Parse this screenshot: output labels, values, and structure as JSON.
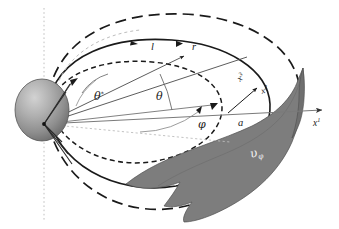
{
  "figure": {
    "background_color": "#ffffff",
    "width": 339,
    "height": 229
  },
  "colors": {
    "stroke": "#1a1a1a",
    "thin_stroke": "#555555",
    "sphere_light": "#c9c9c9",
    "sphere_mid": "#9a9a9a",
    "sphere_dark": "#666666",
    "sphere_edge": "#4a4a4a",
    "surface_gray": "#7d7d7d",
    "surface_edge": "#4f4f4f",
    "axis_gray": "#777777",
    "dotted_axis": "#b9b9b9",
    "label_on_gray": "#f2f2f2"
  },
  "labels": {
    "theta_star": "θ*",
    "theta_star_base": "θ",
    "theta_star_sup": "*",
    "theta": "θ",
    "phi": "φ",
    "ell": "l",
    "r": "r",
    "a": "a",
    "x1_base": "x",
    "x1_sup": "1",
    "x2_base": "x",
    "x2_sup": "2",
    "x3_base": "x",
    "x3_sup": "3",
    "v_phi_base": "υ",
    "v_phi_sub": "φ"
  },
  "elements": {
    "sphere_name": "central-sphere",
    "rotation_axis_name": "rotation-axis-dotted-line",
    "outer_orbit_name": "outer-dashed-orbit",
    "middle_orbit_name": "middle-solid-orbit",
    "inner_orbit_name": "inner-dashed-orbit",
    "surface_name": "velocity-surface",
    "x1_axis_name": "x1-axis",
    "x2_axis_name": "x2-axis",
    "x3_axis_name": "x3-axis"
  }
}
